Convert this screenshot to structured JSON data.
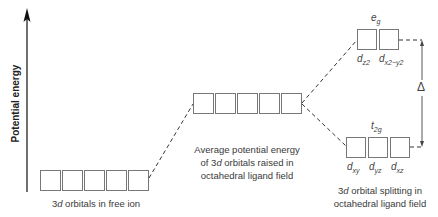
{
  "diagram": {
    "type": "energy-level-diagram",
    "axis": {
      "label": "Potential energy",
      "direction": "up"
    },
    "levels": [
      {
        "id": "free-ion",
        "orbital_count": 5,
        "label": "3d orbitals in free ion",
        "label_parts": {
          "italic": "d",
          "prefix": "3",
          "suffix": " orbitals in free ion"
        }
      },
      {
        "id": "average",
        "orbital_count": 5,
        "label_lines": [
          "Average potential energy",
          "of 3d orbitals raised in",
          "octahedral ligand field"
        ]
      },
      {
        "id": "eg",
        "orbital_count": 2,
        "group_label": "e",
        "group_sub": "g",
        "orbitals": [
          {
            "base": "d",
            "sub": "z2"
          },
          {
            "base": "d",
            "sub": "x2−y2"
          }
        ]
      },
      {
        "id": "t2g",
        "orbital_count": 3,
        "group_label": "t",
        "group_sub": "2g",
        "orbitals": [
          {
            "base": "d",
            "sub": "xy"
          },
          {
            "base": "d",
            "sub": "yz"
          },
          {
            "base": "d",
            "sub": "xz"
          }
        ]
      }
    ],
    "splitting_label": "Δ",
    "right_label_lines": [
      "3d orbital splitting in",
      "octahedral ligand field"
    ]
  },
  "text": {
    "axis_label": "Potential energy",
    "free_prefix": "3",
    "free_italic": "d",
    "free_suffix": " orbitals in free ion",
    "mid_line1": "Average potential energy",
    "mid_line2_pre": "of 3",
    "mid_line2_it": "d",
    "mid_line2_post": " orbitals raised in",
    "mid_line3": "octahedral ligand field",
    "eg_base": "e",
    "eg_sub": "g",
    "t2g_base": "t",
    "t2g_sub": "2g",
    "dz2_sub": "z2",
    "dx2y2_sub": "x2−y2",
    "dxy_sub": "xy",
    "dyz_sub": "yz",
    "dxz_sub": "xz",
    "d": "d",
    "delta": "Δ",
    "right_line1_pre": "3",
    "right_line1_it": "d",
    "right_line1_post": " orbital splitting in",
    "right_line2": "octahedral ligand field"
  }
}
